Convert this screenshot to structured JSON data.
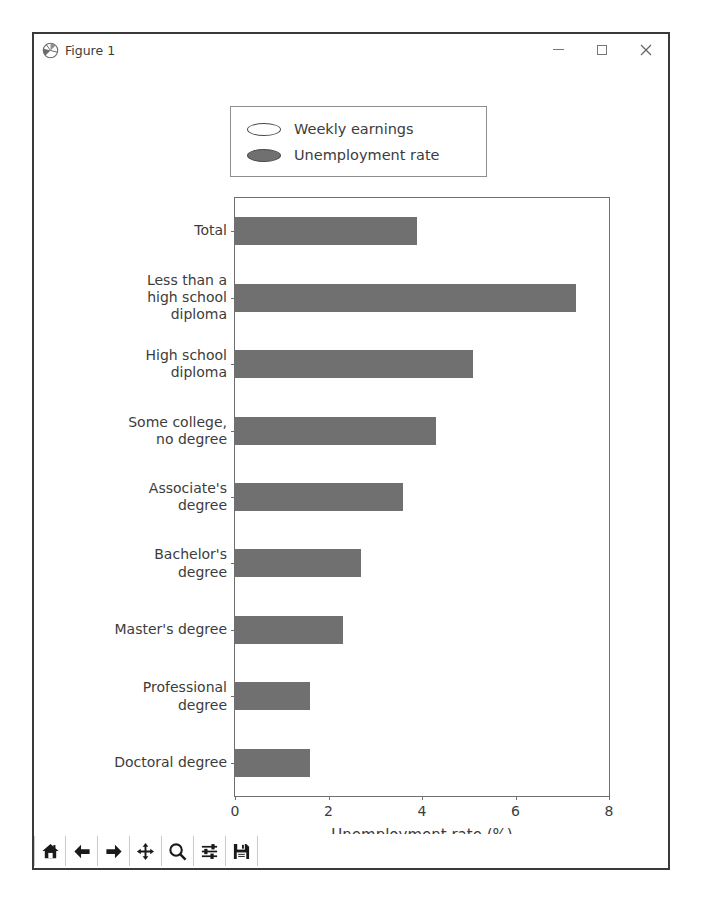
{
  "window": {
    "title": "Figure 1",
    "icon": "matplotlib-icon",
    "controls": [
      {
        "name": "minimize",
        "glyph": "–"
      },
      {
        "name": "maximize",
        "glyph": "□"
      },
      {
        "name": "close",
        "glyph": "✕"
      }
    ]
  },
  "toolbar": {
    "buttons": [
      {
        "name": "home-icon",
        "tooltip": "Home"
      },
      {
        "name": "back-arrow-icon",
        "tooltip": "Back"
      },
      {
        "name": "forward-arrow-icon",
        "tooltip": "Forward"
      },
      {
        "name": "pan-move-icon",
        "tooltip": "Pan"
      },
      {
        "name": "zoom-magnifier-icon",
        "tooltip": "Zoom"
      },
      {
        "name": "configure-subplots-icon",
        "tooltip": "Configure subplots"
      },
      {
        "name": "save-floppy-icon",
        "tooltip": "Save"
      }
    ]
  },
  "legend": {
    "entries": [
      {
        "label": "Weekly earnings",
        "color": "#ffffff",
        "edge": "#4a4a4a"
      },
      {
        "label": "Unemployment rate",
        "color": "#707070",
        "edge": "#4a4a4a"
      }
    ]
  },
  "chart_data": {
    "type": "bar",
    "orientation": "horizontal",
    "title": "",
    "xlabel": "Unemployment rate (%)",
    "ylabel": "",
    "xlim": [
      0,
      8
    ],
    "ylim": [
      0,
      9
    ],
    "xticks": [
      0,
      2,
      4,
      6,
      8
    ],
    "xticklabels": [
      "0",
      "2",
      "4",
      "6",
      "8"
    ],
    "grid": false,
    "legend_position": "upper left (outside axes)",
    "bar_color": "#707070",
    "categories": [
      "Total",
      "Less than a\nhigh school\ndiploma",
      "High school\ndiploma",
      "Some college,\nno degree",
      "Associate's\ndegree",
      "Bachelor's\ndegree",
      "Master's degree",
      "Professional\ndegree",
      "Doctoral degree"
    ],
    "series": [
      {
        "name": "Unemployment rate",
        "values": [
          3.9,
          7.3,
          5.1,
          4.3,
          3.6,
          2.7,
          2.3,
          1.6,
          1.6
        ]
      }
    ]
  }
}
